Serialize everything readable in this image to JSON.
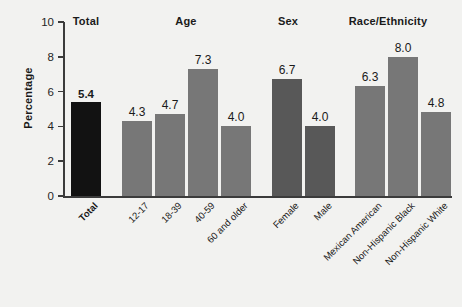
{
  "chart_data": {
    "type": "bar",
    "title": "",
    "subtitle": "",
    "xlabel": "",
    "ylabel": "Percentage",
    "ylim": [
      0,
      10
    ],
    "yticks": [
      0,
      2,
      4,
      6,
      8,
      10
    ],
    "grid": false,
    "legend": "none",
    "group_headings": [
      "Total",
      "Age",
      "Sex",
      "Race/Ethnicity"
    ],
    "categories": [
      "Total",
      "12-17",
      "18-39",
      "40-59",
      "60 and older",
      "Female",
      "Male",
      "Mexican American",
      "Non-Hispanic Black",
      "Non-Hispanic White"
    ],
    "values": [
      5.4,
      4.3,
      4.7,
      7.3,
      4.0,
      6.7,
      4.0,
      6.3,
      8.0,
      4.8
    ],
    "value_labels": [
      "5.4",
      "4.3",
      "4.7",
      "7.3",
      "4.0",
      "6.7",
      "4.0",
      "6.3",
      "8.0",
      "4.8"
    ],
    "bars": [
      {
        "category": "Total",
        "value": 5.4,
        "label": "5.4",
        "group": "Total",
        "color": "#121212",
        "emphasis": true,
        "x": 71,
        "w": 30
      },
      {
        "category": "12-17",
        "value": 4.3,
        "label": "4.3",
        "group": "Age",
        "color": "#777777",
        "emphasis": false,
        "x": 122,
        "w": 30
      },
      {
        "category": "18-39",
        "value": 4.7,
        "label": "4.7",
        "group": "Age",
        "color": "#777777",
        "emphasis": false,
        "x": 155,
        "w": 30
      },
      {
        "category": "40-59",
        "value": 7.3,
        "label": "7.3",
        "group": "Age",
        "color": "#777777",
        "emphasis": false,
        "x": 188,
        "w": 30
      },
      {
        "category": "60 and older",
        "value": 4.0,
        "label": "4.0",
        "group": "Age",
        "color": "#777777",
        "emphasis": false,
        "x": 221,
        "w": 30
      },
      {
        "category": "Female",
        "value": 6.7,
        "label": "6.7",
        "group": "Sex",
        "color": "#585858",
        "emphasis": false,
        "x": 272,
        "w": 30
      },
      {
        "category": "Male",
        "value": 4.0,
        "label": "4.0",
        "group": "Sex",
        "color": "#585858",
        "emphasis": false,
        "x": 305,
        "w": 30
      },
      {
        "category": "Mexican American",
        "value": 6.3,
        "label": "6.3",
        "group": "Race/Ethnicity",
        "color": "#777777",
        "emphasis": false,
        "x": 355,
        "w": 30
      },
      {
        "category": "Non-Hispanic Black",
        "value": 8.0,
        "label": "8.0",
        "group": "Race/Ethnicity",
        "color": "#777777",
        "emphasis": false,
        "x": 388,
        "w": 30
      },
      {
        "category": "Non-Hispanic White",
        "value": 4.8,
        "label": "4.8",
        "group": "Race/Ethnicity",
        "color": "#777777",
        "emphasis": false,
        "x": 421,
        "w": 30
      }
    ],
    "headings_positions": [
      {
        "label": "Total",
        "x": 86
      },
      {
        "label": "Age",
        "x": 186
      },
      {
        "label": "Sex",
        "x": 288
      },
      {
        "label": "Race/Ethnicity",
        "x": 388
      }
    ],
    "colors": {
      "background": "#f2f2f0",
      "axis": "#3b3b3b",
      "text": "#1a1a1a",
      "bar_total": "#121212",
      "bar_age": "#777777",
      "bar_sex": "#585858",
      "bar_race": "#777777"
    }
  }
}
